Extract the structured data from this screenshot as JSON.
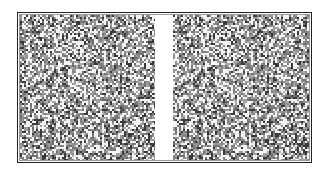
{
  "figure": {
    "panels": [
      {
        "id": "left",
        "x": 20,
        "y": 15,
        "width": 135,
        "height": 145,
        "seed": 1337
      },
      {
        "id": "right",
        "x": 173,
        "y": 15,
        "width": 136,
        "height": 145,
        "seed": 1337,
        "shift": 3
      }
    ],
    "dot_size": 2,
    "colors": {
      "background": "#ffffff",
      "frame": "#222222",
      "dark": "#3a3a3a",
      "mid": "#8c8c8c",
      "light": "#f4f4f4"
    },
    "density": {
      "white": 0.34,
      "dark": 0.16
    }
  }
}
